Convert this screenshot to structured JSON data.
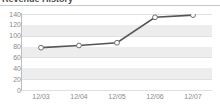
{
  "widget": {
    "title": "Revenue History"
  },
  "chart_data": {
    "type": "line",
    "title": "Revenue History",
    "xlabel": "",
    "ylabel": "",
    "categories": [
      "12/03",
      "12/04",
      "12/05",
      "12/06",
      "12/07"
    ],
    "values": [
      78,
      82,
      87,
      134,
      138
    ],
    "series": [
      {
        "name": "Revenue",
        "values": [
          78,
          82,
          87,
          134,
          138
        ]
      }
    ],
    "ylim": [
      0,
      140
    ],
    "yticks": [
      0,
      20,
      40,
      60,
      80,
      100,
      120,
      140
    ],
    "ytick_labels": [
      "0",
      "20",
      "40",
      "60",
      "80",
      "100",
      "120",
      "140"
    ],
    "grid": true,
    "grid_style": "horizontal-banded",
    "legend": false,
    "marker": "open-circle",
    "colors": {
      "line": "#555555",
      "marker_fill": "#ffffff",
      "marker_stroke": "#6f6f6f",
      "band": "#ededed",
      "plot_background": "#ffffff",
      "axis": "#bdbdbd",
      "tick_label": "#8a8a8a",
      "title": "#4a4a4a"
    }
  }
}
